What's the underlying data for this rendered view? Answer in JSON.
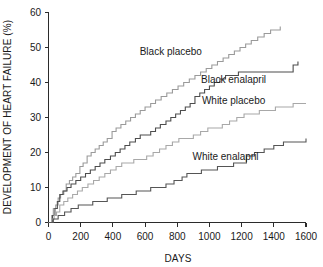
{
  "chart_data": {
    "type": "line",
    "title": "",
    "subtitle": "",
    "xlabel": "DAYS",
    "ylabel": "DEVELOPMENT OF HEART FAILURE (%)",
    "xlim": [
      0,
      1600
    ],
    "ylim": [
      0,
      60
    ],
    "xticks": [
      0,
      200,
      400,
      600,
      800,
      1000,
      1200,
      1400,
      1600
    ],
    "xtick_labels": [
      "0",
      "200",
      "400",
      "600",
      "800",
      "1000",
      "1200",
      "1400",
      "1600"
    ],
    "yticks": [
      0,
      10,
      20,
      30,
      40,
      50,
      60
    ],
    "ytick_labels": [
      "0",
      "10",
      "20",
      "30",
      "40",
      "50",
      "60"
    ],
    "grid": false,
    "legend_position": "inline-annotations",
    "curve_style": "step-post (Kaplan-Meier cumulative incidence)",
    "series": [
      {
        "name": "Black placebo",
        "color": "#9a9a9a",
        "label_x": 760,
        "label_y": 49,
        "final_x": 1440,
        "final_y": 56,
        "x": [
          0,
          20,
          30,
          45,
          60,
          75,
          95,
          110,
          130,
          150,
          170,
          195,
          215,
          240,
          265,
          290,
          315,
          340,
          365,
          395,
          420,
          450,
          480,
          510,
          540,
          570,
          600,
          635,
          665,
          700,
          735,
          770,
          805,
          840,
          875,
          910,
          945,
          980,
          1015,
          1050,
          1085,
          1120,
          1155,
          1190,
          1225,
          1260,
          1300,
          1340,
          1380,
          1410,
          1440
        ],
        "y": [
          0,
          2,
          4,
          5,
          7,
          8,
          9,
          11,
          12,
          13,
          14,
          16,
          17,
          19,
          20,
          21,
          22,
          23,
          24,
          26,
          27,
          28,
          29,
          30,
          31,
          32,
          33,
          34,
          35,
          36,
          37,
          38,
          39,
          40,
          41,
          42,
          43,
          44,
          45,
          46,
          47,
          48,
          49,
          50,
          51,
          52,
          53,
          54,
          55,
          55,
          56
        ]
      },
      {
        "name": "Black enalapril",
        "color": "#4d4d4d",
        "label_x": 1150,
        "label_y": 41,
        "final_x": 1550,
        "final_y": 46,
        "x": [
          0,
          25,
          40,
          55,
          70,
          90,
          115,
          140,
          170,
          200,
          230,
          260,
          290,
          320,
          350,
          385,
          415,
          445,
          475,
          505,
          540,
          570,
          600,
          635,
          665,
          695,
          730,
          760,
          790,
          820,
          850,
          880,
          910,
          940,
          970,
          1000,
          1030,
          1065,
          1100,
          1140,
          1180,
          1230,
          1290,
          1350,
          1420,
          1490,
          1520,
          1550
        ],
        "y": [
          0,
          2,
          4,
          6,
          8,
          9,
          10,
          11,
          12,
          13,
          14,
          15,
          16,
          17,
          18,
          19,
          20,
          21,
          22,
          23,
          24,
          25,
          25,
          26,
          27,
          28,
          29,
          30,
          31,
          32,
          33,
          34,
          36,
          37,
          38,
          39,
          40,
          41,
          42,
          42,
          43,
          43,
          43,
          43,
          43,
          43,
          45,
          46
        ]
      },
      {
        "name": "White placebo",
        "color": "#a8a8a8",
        "label_x": 1150,
        "label_y": 35,
        "final_x": 1600,
        "final_y": 34,
        "x": [
          0,
          20,
          35,
          50,
          70,
          95,
          120,
          150,
          180,
          210,
          245,
          280,
          315,
          350,
          385,
          420,
          455,
          490,
          530,
          570,
          610,
          650,
          690,
          730,
          770,
          810,
          855,
          900,
          945,
          990,
          1035,
          1080,
          1125,
          1170,
          1215,
          1260,
          1310,
          1360,
          1410,
          1460,
          1520,
          1570,
          1600
        ],
        "y": [
          0,
          1,
          2,
          3,
          5,
          6,
          7,
          8,
          9,
          10,
          11,
          12,
          13,
          14,
          15,
          16,
          17,
          17,
          18,
          18,
          19,
          20,
          21,
          22,
          23,
          24,
          24,
          25,
          26,
          27,
          27,
          28,
          29,
          30,
          31,
          31,
          32,
          32,
          33,
          33,
          34,
          34,
          34
        ]
      },
      {
        "name": "White enalapril",
        "color": "#555555",
        "label_x": 1100,
        "label_y": 19,
        "final_x": 1600,
        "final_y": 24,
        "x": [
          0,
          30,
          60,
          100,
          140,
          185,
          230,
          275,
          320,
          365,
          410,
          455,
          500,
          545,
          590,
          635,
          680,
          730,
          780,
          830,
          860,
          900,
          950,
          1000,
          1050,
          1100,
          1150,
          1200,
          1230,
          1280,
          1340,
          1400,
          1460,
          1520,
          1600
        ],
        "y": [
          0,
          1,
          2,
          3,
          4,
          5,
          5,
          6,
          6,
          7,
          7,
          8,
          8,
          9,
          9,
          10,
          10,
          11,
          12,
          13,
          14,
          14,
          15,
          15,
          16,
          16,
          17,
          17,
          19,
          20,
          21,
          22,
          23,
          23,
          24
        ]
      }
    ]
  }
}
